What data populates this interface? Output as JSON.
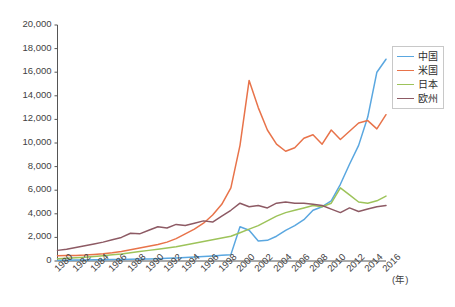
{
  "chart_data": {
    "type": "line",
    "title": "",
    "subtitle": "",
    "xlabel": "(年)",
    "ylabel": "",
    "xlim": [
      1980,
      2016
    ],
    "ylim": [
      0,
      20000
    ],
    "grid": false,
    "legend_position": "right",
    "x": [
      1980,
      1981,
      1982,
      1983,
      1984,
      1985,
      1986,
      1987,
      1988,
      1989,
      1990,
      1991,
      1992,
      1993,
      1994,
      1995,
      1996,
      1997,
      1998,
      1999,
      2000,
      2001,
      2002,
      2003,
      2004,
      2005,
      2006,
      2007,
      2008,
      2009,
      2010,
      2011,
      2012,
      2013,
      2014,
      2015,
      2016
    ],
    "x_tick_labels": [
      "1980",
      "1982",
      "1984",
      "1986",
      "1988",
      "1990",
      "1992",
      "1994",
      "1996",
      "1998",
      "2000",
      "2002",
      "2004",
      "2006",
      "2008",
      "2010",
      "2012",
      "2014",
      "2016"
    ],
    "y_tick_labels": [
      "0",
      "2,000",
      "4,000",
      "6,000",
      "8,000",
      "10,000",
      "12,000",
      "14,000",
      "16,000",
      "18,000",
      "20,000"
    ],
    "y_tick_values": [
      0,
      2000,
      4000,
      6000,
      8000,
      10000,
      12000,
      14000,
      16000,
      18000,
      20000
    ],
    "series": [
      {
        "name": "中国",
        "color": "#5aa7e0",
        "values": [
          60,
          70,
          80,
          90,
          100,
          110,
          120,
          130,
          150,
          160,
          180,
          200,
          230,
          260,
          300,
          340,
          380,
          430,
          480,
          540,
          2900,
          2600,
          1700,
          1750,
          2100,
          2600,
          3000,
          3500,
          4300,
          4600,
          5100,
          6500,
          8200,
          9800,
          12200,
          16000,
          17100
        ]
      },
      {
        "name": "米国",
        "color": "#e8734a",
        "values": [
          450,
          460,
          470,
          500,
          560,
          620,
          700,
          800,
          950,
          1100,
          1250,
          1400,
          1600,
          1900,
          2300,
          2700,
          3200,
          3900,
          4800,
          6200,
          9800,
          15300,
          13000,
          11100,
          9900,
          9300,
          9600,
          10400,
          10700,
          9900,
          11100,
          10300,
          11000,
          11700,
          11900,
          11200,
          12400
        ]
      },
      {
        "name": "日本",
        "color": "#9dc35a",
        "values": [
          200,
          230,
          270,
          320,
          380,
          450,
          520,
          600,
          700,
          800,
          900,
          1000,
          1100,
          1200,
          1350,
          1500,
          1650,
          1800,
          1950,
          2100,
          2400,
          2700,
          3000,
          3400,
          3800,
          4100,
          4300,
          4500,
          4700,
          4600,
          4900,
          6200,
          5600,
          5000,
          4900,
          5100,
          5500
        ]
      },
      {
        "name": "欧州",
        "color": "#8d5a64",
        "values": [
          900,
          1000,
          1150,
          1300,
          1450,
          1600,
          1800,
          2000,
          2350,
          2300,
          2600,
          2900,
          2800,
          3100,
          3000,
          3200,
          3400,
          3300,
          3800,
          4300,
          4900,
          4600,
          4700,
          4500,
          4900,
          5000,
          4900,
          4900,
          4800,
          4700,
          4400,
          4100,
          4500,
          4200,
          4400,
          4600,
          4700
        ]
      }
    ]
  }
}
